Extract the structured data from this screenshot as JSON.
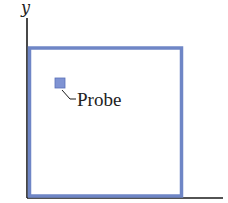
{
  "diagram": {
    "axes": {
      "y_label": "y",
      "x_label": ""
    },
    "region": {
      "label": "square region",
      "border_color": "#6f86c6"
    },
    "probe": {
      "label": "Probe",
      "fill_color": "#7f93d3"
    },
    "colors": {
      "axis": "#1a1a1a",
      "text": "#222222"
    }
  }
}
